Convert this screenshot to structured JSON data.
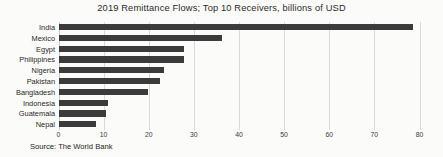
{
  "chart_data": {
    "type": "bar",
    "orientation": "horizontal",
    "title": "2019 Remittance Flows; Top 10 Receivers, billions of USD",
    "xlabel": "",
    "ylabel": "",
    "xlim": [
      0,
      80
    ],
    "ylim": null,
    "grid": true,
    "legend": null,
    "source": "Source: The World Bank",
    "bar_color": "#3b3b3b",
    "gridline_color": "#d9d9d6",
    "background_color": "#fbfbf9",
    "xticks": [
      0,
      10,
      20,
      30,
      40,
      50,
      60,
      70,
      80
    ],
    "xtick_labels": [
      "0",
      "10",
      "20",
      "30",
      "40",
      "50",
      "60",
      "70",
      "80"
    ],
    "categories": [
      "India",
      "Mexico",
      "Egypt",
      "Philippines",
      "Nigeria",
      "Pakistan",
      "Bangladesh",
      "Indonesia",
      "Guatemala",
      "Nepal"
    ],
    "values": [
      78.6,
      36.3,
      27.8,
      27.8,
      23.3,
      22.5,
      19.9,
      11.0,
      10.5,
      8.3
    ],
    "units": "billions of USD",
    "year": 2019
  }
}
